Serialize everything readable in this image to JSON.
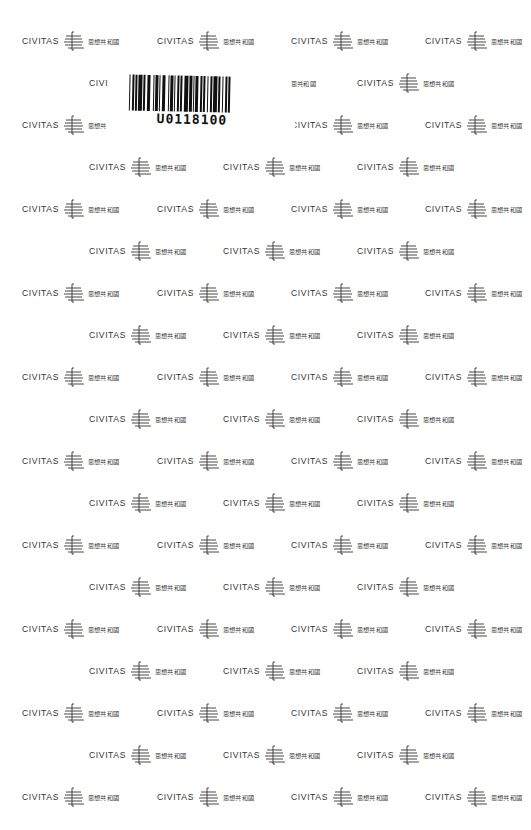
{
  "pattern": {
    "brand_latin": "CIVITAS",
    "brand_chinese": "思想共和國",
    "mark_icon": "civitas-harp-mark-icon",
    "ink_color": "#333333",
    "background_color": "#ffffff"
  },
  "partial_labels": {
    "row2_left": "CIVI",
    "row2_right_fragment": "思共和國",
    "row3_left_chinese": "思想共"
  },
  "barcode": {
    "code": "U0118100",
    "color": "#111111"
  }
}
